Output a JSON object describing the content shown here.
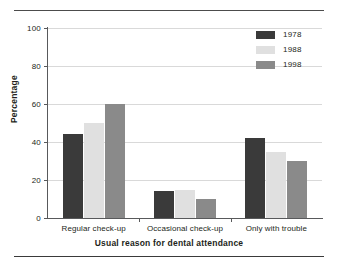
{
  "chart_data": {
    "type": "bar",
    "title": "",
    "xlabel": "Usual reason for dental attendance",
    "ylabel": "Percentage",
    "categories": [
      "Regular check-up",
      "Occasional check-up",
      "Only with trouble"
    ],
    "series": [
      {
        "name": "1978",
        "color": "#3a3a3a",
        "values": [
          44,
          14,
          42
        ]
      },
      {
        "name": "1988",
        "color": "#e0e0e0",
        "values": [
          50,
          15,
          35
        ]
      },
      {
        "name": "1998",
        "color": "#8a8a8a",
        "values": [
          60,
          10,
          30
        ]
      }
    ],
    "ylim": [
      0,
      100
    ],
    "yticks": [
      0,
      20,
      40,
      60,
      80,
      100
    ],
    "ytick_labels": [
      "0",
      "20",
      "40",
      "60",
      "80",
      "100"
    ],
    "grid": true,
    "legend_position": "top-right"
  },
  "axes": {
    "y_title": "Percentage",
    "x_title": "Usual reason for dental attendance"
  }
}
